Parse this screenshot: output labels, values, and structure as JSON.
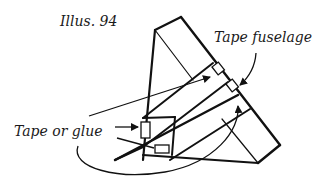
{
  "figure": {
    "title": "Illus. 94",
    "labels": {
      "tape_fuselage": "Tape fuselage",
      "tape_or_glue": "Tape or glue"
    }
  },
  "colors": {
    "line": "#111111",
    "background": "#ffffff"
  }
}
